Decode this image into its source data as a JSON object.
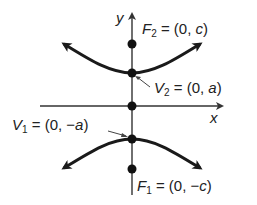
{
  "diagram": {
    "type": "hyperbola-vertical-transverse-axis",
    "axes": {
      "x_label": "x",
      "y_label": "y"
    },
    "points": {
      "F2": {
        "name": "F",
        "sub": "2",
        "value": " = (0, ",
        "var": "c",
        "close": ")"
      },
      "V2": {
        "name": "V",
        "sub": "2",
        "value": " = (0, ",
        "var": "a",
        "close": ")"
      },
      "V1": {
        "name": "V",
        "sub": "1",
        "value": " = (0, −",
        "var": "a",
        "close": ")"
      },
      "F1": {
        "name": "F",
        "sub": "1",
        "value": " = (0, −",
        "var": "c",
        "close": ")"
      }
    },
    "colors": {
      "curve": "#1a1a1a",
      "axis": "#333333",
      "point": "#111111",
      "text": "#222222"
    }
  }
}
